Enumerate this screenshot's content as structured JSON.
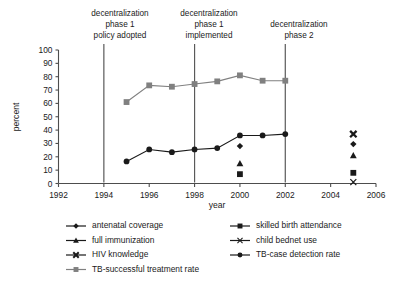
{
  "chart_data": {
    "type": "line",
    "title": "",
    "xlabel": "year",
    "ylabel": "percent",
    "xlim": [
      1992,
      2006
    ],
    "ylim": [
      0,
      100
    ],
    "xticks": [
      1992,
      1994,
      1996,
      1998,
      2000,
      2002,
      2004,
      2006
    ],
    "yticks": [
      0,
      10,
      20,
      30,
      40,
      50,
      60,
      70,
      80,
      90,
      100
    ],
    "grid": false,
    "legend_position": "below-axes",
    "annotations": [
      {
        "text_lines": [
          "decentralization",
          "phase 1",
          "policy adopted"
        ],
        "x": 1994,
        "type": "vertical-line-label"
      },
      {
        "text_lines": [
          "decentralization",
          "phase 1",
          "implemented"
        ],
        "x": 1998,
        "type": "vertical-line-label"
      },
      {
        "text_lines": [
          "decentralization",
          "phase 2"
        ],
        "x": 2002,
        "type": "vertical-line-label"
      }
    ],
    "vertical_lines": [
      1994,
      1998,
      2002
    ],
    "series": [
      {
        "name": "TB-successful treatment rate",
        "marker": "square",
        "color": "#808080",
        "connected": true,
        "x": [
          1995,
          1996,
          1997,
          1998,
          1999,
          2000,
          2001,
          2002
        ],
        "values": [
          61,
          73.5,
          72.5,
          74.5,
          76.5,
          81,
          77,
          77
        ]
      },
      {
        "name": "TB-case detection rate",
        "marker": "circle",
        "color": "#1a1a1a",
        "connected": true,
        "x": [
          1995,
          1996,
          1997,
          1998,
          1999,
          2000,
          2001,
          2002
        ],
        "values": [
          16.5,
          25.5,
          23.5,
          25.5,
          26.5,
          36,
          36,
          37
        ]
      },
      {
        "name": "antenatal coverage",
        "marker": "diamond",
        "color": "#1a1a1a",
        "connected": false,
        "x": [
          2000,
          2005
        ],
        "values": [
          28,
          29.5
        ]
      },
      {
        "name": "full immunization",
        "marker": "triangle",
        "color": "#1a1a1a",
        "connected": false,
        "x": [
          2000,
          2005
        ],
        "values": [
          15,
          21
        ]
      },
      {
        "name": "skilled birth attendance",
        "marker": "square",
        "color": "#1a1a1a",
        "connected": false,
        "x": [
          2000,
          2005
        ],
        "values": [
          7,
          8
        ]
      },
      {
        "name": "HIV knowledge",
        "marker": "x-bold",
        "color": "#1a1a1a",
        "connected": false,
        "x": [
          2005
        ],
        "values": [
          37
        ]
      },
      {
        "name": "child bednet use",
        "marker": "x",
        "color": "#1a1a1a",
        "connected": false,
        "x": [
          2005
        ],
        "values": [
          1
        ]
      }
    ]
  },
  "legend": {
    "column_left": [
      {
        "label": "antenatal coverage",
        "marker": "diamond",
        "color": "#1a1a1a"
      },
      {
        "label": "full immunization",
        "marker": "triangle",
        "color": "#1a1a1a"
      },
      {
        "label": "HIV knowledge",
        "marker": "x-bold",
        "color": "#1a1a1a"
      },
      {
        "label": "TB-successful treatment rate",
        "marker": "square",
        "color": "#808080"
      }
    ],
    "column_right": [
      {
        "label": "skilled birth attendance",
        "marker": "square",
        "color": "#1a1a1a"
      },
      {
        "label": "child bednet use",
        "marker": "x",
        "color": "#1a1a1a"
      },
      {
        "label": "TB-case detection rate",
        "marker": "circle",
        "color": "#1a1a1a"
      }
    ]
  },
  "axis": {
    "y_title": "percent",
    "x_title": "year",
    "y_tick_labels": [
      "100",
      "90",
      "80",
      "70",
      "60",
      "50",
      "40",
      "30",
      "20",
      "10",
      "0"
    ],
    "x_tick_labels": [
      "1992",
      "1994",
      "1996",
      "1998",
      "2000",
      "2002",
      "2004",
      "2006"
    ]
  },
  "annotations": {
    "a1": {
      "l1": "decentralization",
      "l2": "phase 1",
      "l3": "policy adopted"
    },
    "a2": {
      "l1": "decentralization",
      "l2": "phase 1",
      "l3": "implemented"
    },
    "a3": {
      "l1": "decentralization",
      "l2": "phase 2"
    }
  },
  "colors": {
    "axis": "#4d4d4d",
    "gray_series": "#808080",
    "black_series": "#1a1a1a",
    "background": "#ffffff"
  }
}
